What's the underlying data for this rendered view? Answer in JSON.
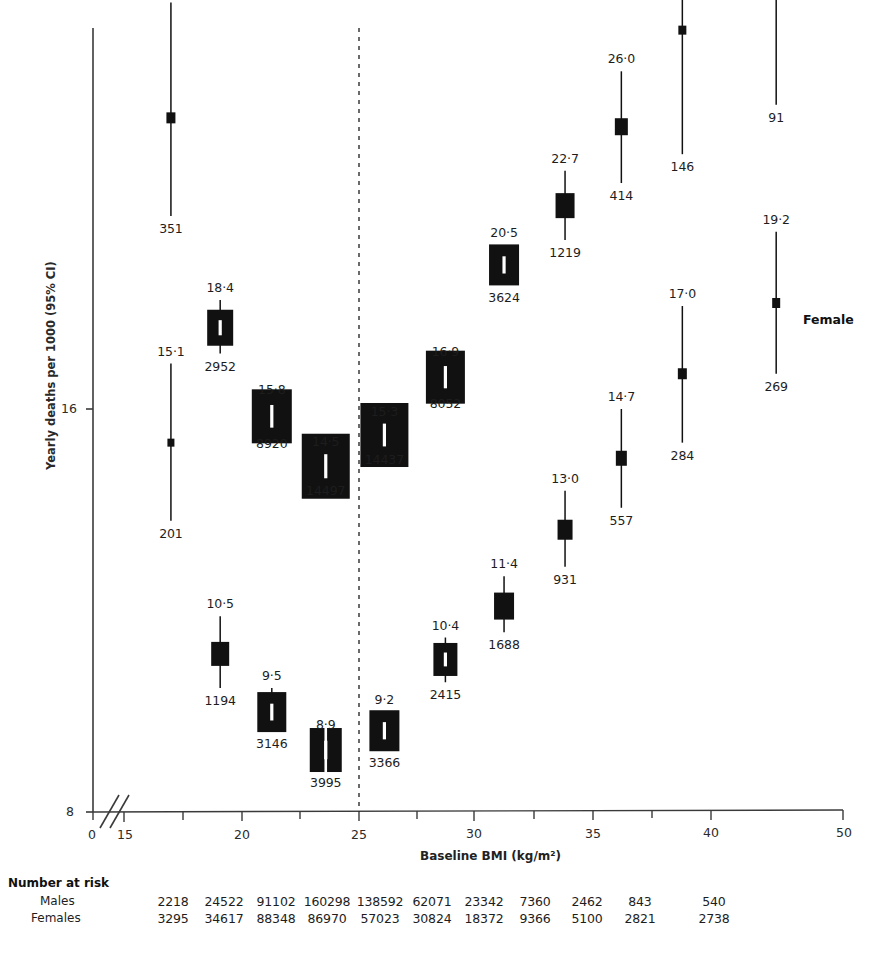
{
  "figure": {
    "ylabel": "Yearly deaths per 1000 (95% CI)",
    "xlabel": "Baseline BMI (kg/m²)",
    "female_series_label": "Female",
    "marker_color": "#111111",
    "axis_color": "#3a3a3a",
    "reference_line_bmi": "25"
  },
  "axes": {
    "y_ticks": [
      "16",
      "8"
    ],
    "x_ticks": [
      "0",
      "15",
      "20",
      "25",
      "30",
      "35",
      "40",
      "50"
    ],
    "x_break": true
  },
  "chart_data": {
    "type": "scatter",
    "title": "",
    "xlabel": "Baseline BMI (kg/m²)",
    "ylabel": "Yearly deaths per 1000 (95% CI)",
    "yscale": "log",
    "ylim": [
      8,
      40
    ],
    "xlim": [
      15,
      50
    ],
    "y_ticks": [
      8,
      16
    ],
    "x_ticks": [
      15,
      20,
      25,
      30,
      35,
      40,
      50
    ],
    "grid": false,
    "legend": "inline-right",
    "reference_line_x": 25,
    "annotations": [
      "Female"
    ],
    "series": [
      {
        "name": "Males",
        "points": [
          {
            "bmi": 17.0,
            "value": "26·4",
            "deaths": "351",
            "ci_low": 22.3,
            "ci_high": 32.2,
            "box_w": 9,
            "box_h": 11
          },
          {
            "bmi": 19.1,
            "value": "18·4",
            "deaths": "2952",
            "ci_low": 17.6,
            "ci_high": 19.3,
            "box_w": 26,
            "box_h": 36
          },
          {
            "bmi": 21.3,
            "value": "15·8",
            "deaths": "8920",
            "ci_low": 15.4,
            "ci_high": 16.2,
            "box_w": 40,
            "box_h": 54
          },
          {
            "bmi": 23.6,
            "value": "14·5",
            "deaths": "14497",
            "ci_low": 14.2,
            "ci_high": 14.8,
            "box_w": 48,
            "box_h": 65
          },
          {
            "bmi": 26.1,
            "value": "15·3",
            "deaths": "14437",
            "ci_low": 15.0,
            "ci_high": 15.6,
            "box_w": 48,
            "box_h": 64
          },
          {
            "bmi": 28.7,
            "value": "16·9",
            "deaths": "8052",
            "ci_low": 16.5,
            "ci_high": 17.3,
            "box_w": 39,
            "box_h": 53
          },
          {
            "bmi": 31.2,
            "value": "20·5",
            "deaths": "3624",
            "ci_low": 19.8,
            "ci_high": 21.2,
            "box_w": 30,
            "box_h": 41
          },
          {
            "bmi": 33.8,
            "value": "22·7",
            "deaths": "1219",
            "ci_low": 21.4,
            "ci_high": 24.1,
            "box_w": 19,
            "box_h": 25
          },
          {
            "bmi": 36.2,
            "value": "26·0",
            "deaths": "414",
            "ci_low": 23.6,
            "ci_high": 28.6,
            "box_w": 13,
            "box_h": 17
          },
          {
            "bmi": 38.8,
            "value": "",
            "deaths": "146",
            "ci_low": 24.8,
            "ci_high": 38.0,
            "box_w": 8,
            "box_h": 9
          },
          {
            "bmi": 42.8,
            "value": "",
            "deaths": "91",
            "ci_low": 27.0,
            "ci_high": 45.0,
            "box_w": 0,
            "box_h": 0
          }
        ]
      },
      {
        "name": "Females",
        "points": [
          {
            "bmi": 17.0,
            "value": "15·1",
            "deaths": "201",
            "ci_low": 13.2,
            "ci_high": 17.3,
            "box_w": 7,
            "box_h": 8
          },
          {
            "bmi": 19.1,
            "value": "10·5",
            "deaths": "1194",
            "ci_low": 9.9,
            "ci_high": 11.2,
            "box_w": 18,
            "box_h": 24
          },
          {
            "bmi": 21.3,
            "value": "9·5",
            "deaths": "3146",
            "ci_low": 9.2,
            "ci_high": 9.9,
            "box_w": 29,
            "box_h": 40
          },
          {
            "bmi": 23.6,
            "value": "8·9",
            "deaths": "3995",
            "ci_low": 8.6,
            "ci_high": 9.1,
            "box_w": 32,
            "box_h": 44
          },
          {
            "bmi": 26.1,
            "value": "9·2",
            "deaths": "3366",
            "ci_low": 8.9,
            "ci_high": 9.5,
            "box_w": 30,
            "box_h": 41
          },
          {
            "bmi": 28.7,
            "value": "10·4",
            "deaths": "2415",
            "ci_low": 10.0,
            "ci_high": 10.8,
            "box_w": 24,
            "box_h": 33
          },
          {
            "bmi": 31.2,
            "value": "11·4",
            "deaths": "1688",
            "ci_low": 10.9,
            "ci_high": 12.0,
            "box_w": 20,
            "box_h": 27
          },
          {
            "bmi": 33.8,
            "value": "13·0",
            "deaths": "931",
            "ci_low": 12.2,
            "ci_high": 13.9,
            "box_w": 15,
            "box_h": 20
          },
          {
            "bmi": 36.2,
            "value": "14·7",
            "deaths": "557",
            "ci_low": 13.5,
            "ci_high": 16.0,
            "box_w": 11,
            "box_h": 15
          },
          {
            "bmi": 38.8,
            "value": "17·0",
            "deaths": "284",
            "ci_low": 15.1,
            "ci_high": 19.1,
            "box_w": 9,
            "box_h": 11
          },
          {
            "bmi": 42.8,
            "value": "19·2",
            "deaths": "269",
            "ci_low": 17.0,
            "ci_high": 21.7,
            "box_w": 8,
            "box_h": 10
          }
        ]
      }
    ]
  },
  "risk_table": {
    "title": "Number at risk",
    "rows": [
      {
        "label": "Males",
        "values": [
          "2218",
          "24522",
          "91102",
          "160298",
          "138592",
          "62071",
          "23342",
          "7360",
          "2462",
          "843",
          "540"
        ]
      },
      {
        "label": "Females",
        "values": [
          "3295",
          "34617",
          "88348",
          "86970",
          "57023",
          "30824",
          "18372",
          "9366",
          "5100",
          "2821",
          "2738"
        ]
      }
    ]
  }
}
